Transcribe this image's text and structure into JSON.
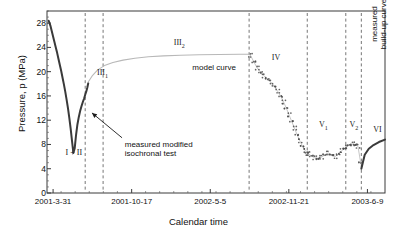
{
  "chart_data": {
    "type": "line",
    "title": "",
    "xlabel": "Calendar time",
    "ylabel": "Pressure, p (MPa)",
    "ylim": [
      0,
      30
    ],
    "yticks": [
      0,
      4,
      8,
      12,
      16,
      20,
      24,
      28
    ],
    "xticklabels": [
      "2001-3-31",
      "2001-10-17",
      "2002-5-5",
      "2002-11-21",
      "2003-6-9"
    ],
    "grid": false,
    "legend_position": "none",
    "series": [
      {
        "name": "measured modified isochronal test",
        "style": "thick-dark-line",
        "x": [
          0.005,
          0.01,
          0.014,
          0.018,
          0.022,
          0.026,
          0.03,
          0.034,
          0.038,
          0.042,
          0.046,
          0.05,
          0.054,
          0.058,
          0.062,
          0.066,
          0.07,
          0.074,
          0.078,
          0.082,
          0.086,
          0.09,
          0.094,
          0.098,
          0.102,
          0.106,
          0.11,
          0.113,
          0.116,
          0.119,
          0.122
        ],
        "y": [
          28.4,
          27.6,
          26.7,
          25.8,
          24.9,
          24.0,
          23.1,
          22.1,
          21.1,
          20.1,
          19.0,
          17.9,
          16.7,
          15.4,
          14.0,
          12.4,
          10.6,
          8.6,
          6.6,
          7.4,
          9.6,
          11.3,
          12.5,
          13.5,
          14.3,
          15.0,
          15.6,
          16.2,
          16.7,
          17.3,
          18.1
        ]
      },
      {
        "name": "model curve",
        "style": "thin-gray-line",
        "x": [
          0.122,
          0.135,
          0.15,
          0.17,
          0.195,
          0.225,
          0.26,
          0.3,
          0.345,
          0.395,
          0.45,
          0.51,
          0.57,
          0.6
        ],
        "y": [
          18.3,
          19.4,
          20.3,
          21.0,
          21.5,
          21.9,
          22.2,
          22.45,
          22.6,
          22.7,
          22.78,
          22.83,
          22.86,
          22.87
        ]
      },
      {
        "name": "segment-IV-decline",
        "style": "markers-and-line",
        "x": [
          0.602,
          0.612,
          0.622,
          0.632,
          0.642,
          0.652,
          0.662,
          0.672,
          0.682,
          0.692,
          0.7,
          0.708,
          0.716,
          0.724,
          0.732,
          0.74,
          0.748,
          0.756,
          0.764,
          0.77
        ],
        "y": [
          22.7,
          21.6,
          20.6,
          19.9,
          19.3,
          18.8,
          18.3,
          17.6,
          16.8,
          15.9,
          15.0,
          14.0,
          12.9,
          11.8,
          10.7,
          9.6,
          8.6,
          7.7,
          7.0,
          6.6
        ]
      },
      {
        "name": "segment-V1-plateau",
        "style": "markers-and-line",
        "x": [
          0.772,
          0.782,
          0.792,
          0.802,
          0.812,
          0.822,
          0.832,
          0.842,
          0.852,
          0.862,
          0.872,
          0.882
        ],
        "y": [
          6.5,
          6.1,
          5.8,
          5.7,
          5.9,
          6.3,
          6.6,
          6.3,
          6.0,
          6.4,
          7.0,
          7.4
        ]
      },
      {
        "name": "segment-V2",
        "style": "markers-and-line",
        "x": [
          0.884,
          0.894,
          0.904,
          0.912,
          0.92,
          0.928
        ],
        "y": [
          7.6,
          7.9,
          8.1,
          8.0,
          7.7,
          5.0
        ]
      },
      {
        "name": "measured build-up curve",
        "style": "thick-dark-line",
        "x": [
          0.93,
          0.94,
          0.952,
          0.966,
          0.982,
          1.0
        ],
        "y": [
          4.0,
          6.3,
          7.3,
          7.9,
          8.4,
          8.8
        ]
      }
    ],
    "region_labels": [
      {
        "id": "I + II",
        "text": "I + II",
        "x": 0.055,
        "y": 6.6
      },
      {
        "id": "III1",
        "text": "III",
        "sub": "1",
        "x": 0.148,
        "y": 19.8
      },
      {
        "id": "III2",
        "text": "III",
        "sub": "2",
        "x": 0.375,
        "y": 24.8
      },
      {
        "id": "IV",
        "text": "IV",
        "x": 0.665,
        "y": 22.3
      },
      {
        "id": "V1",
        "text": "V",
        "sub": "1",
        "x": 0.805,
        "y": 11.2
      },
      {
        "id": "V2",
        "text": "V",
        "sub": "2",
        "x": 0.895,
        "y": 11.2
      },
      {
        "id": "VI",
        "text": "VI",
        "x": 0.965,
        "y": 10.4
      }
    ],
    "dividers_x": [
      0.113,
      0.166,
      0.598,
      0.77,
      0.884,
      0.93
    ],
    "annotations": [
      {
        "id": "model-curve",
        "text": "model curve",
        "x": 0.43,
        "y": 20.6
      },
      {
        "id": "measured-modified-isochronal-test",
        "line1": "measured modified",
        "line2": "isochronal test",
        "x": 0.23,
        "y": 7.9
      },
      {
        "id": "measured-build-up-curve",
        "line1": "measured",
        "line2": "build-up curve",
        "x": 0.955,
        "y": 20.0,
        "orientation": "vertical"
      }
    ]
  },
  "figure": {
    "caption": ""
  }
}
